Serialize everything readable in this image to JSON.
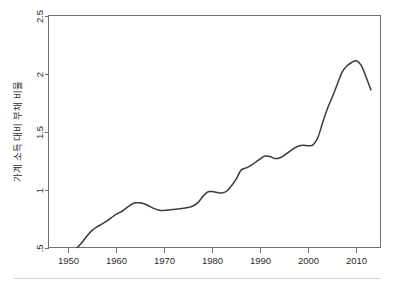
{
  "figure": {
    "background_color": "#ffffff",
    "line_color": "#3a3a3a",
    "axis_color": "#6f6f6f",
    "footer_rule_color": "#d2d2d2"
  },
  "chart_data": {
    "type": "line",
    "title": "",
    "subtitle": "",
    "xlabel": "",
    "ylabel": "가계 소득 대비 부채 비율",
    "ylabel_rotation": "90",
    "xlim": [
      1946,
      2015
    ],
    "ylim": [
      0.5,
      2.5
    ],
    "grid": false,
    "legend": false,
    "legend_position": "none",
    "xticks": [
      1950,
      1960,
      1970,
      1980,
      1990,
      2000,
      2010
    ],
    "xtick_labels": [
      "1950",
      "1960",
      "1970",
      "1980",
      "1990",
      "2000",
      "2010"
    ],
    "yticks": [
      0.5,
      1,
      1.5,
      2,
      2.5
    ],
    "ytick_labels": [
      ".5",
      "1",
      "1.5",
      "2",
      "2.5"
    ],
    "series": [
      {
        "name": "가계 소득 대비 부채 비율",
        "color": "#3a3a3a",
        "x": [
          1952,
          1953,
          1954,
          1955,
          1956,
          1957,
          1958,
          1959,
          1960,
          1961,
          1962,
          1963,
          1964,
          1965,
          1966,
          1967,
          1968,
          1969,
          1970,
          1971,
          1972,
          1973,
          1974,
          1975,
          1976,
          1977,
          1978,
          1979,
          1980,
          1981,
          1982,
          1983,
          1984,
          1985,
          1986,
          1987,
          1988,
          1989,
          1990,
          1991,
          1992,
          1993,
          1994,
          1995,
          1996,
          1997,
          1998,
          1999,
          2000,
          2001,
          2002,
          2003,
          2004,
          2005,
          2006,
          2007,
          2008,
          2009,
          2010,
          2011,
          2012,
          2013
        ],
        "y": [
          0.5,
          0.545,
          0.6,
          0.645,
          0.675,
          0.7,
          0.725,
          0.755,
          0.785,
          0.805,
          0.835,
          0.865,
          0.885,
          0.885,
          0.875,
          0.855,
          0.835,
          0.822,
          0.82,
          0.823,
          0.828,
          0.833,
          0.838,
          0.845,
          0.858,
          0.885,
          0.935,
          0.978,
          0.982,
          0.975,
          0.97,
          0.985,
          1.03,
          1.09,
          1.165,
          1.185,
          1.205,
          1.235,
          1.265,
          1.288,
          1.285,
          1.268,
          1.272,
          1.295,
          1.325,
          1.355,
          1.375,
          1.382,
          1.378,
          1.385,
          1.45,
          1.58,
          1.7,
          1.8,
          1.905,
          2.01,
          2.065,
          2.095,
          2.11,
          2.07,
          1.97,
          1.86
        ]
      }
    ]
  }
}
